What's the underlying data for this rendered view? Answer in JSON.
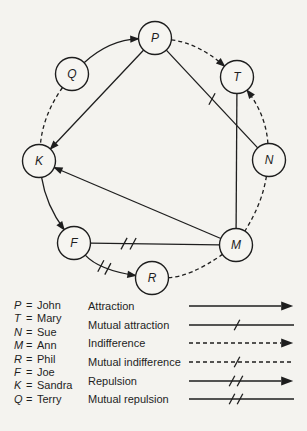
{
  "figure": {
    "background": "#f4f3ef",
    "ink": "#1e1e1e",
    "node_fill": "#f6f5f1"
  },
  "diagram": {
    "node_radius": 16.5,
    "nodes": [
      {
        "id": "P",
        "label": "P",
        "x": 155,
        "y": 38
      },
      {
        "id": "Q",
        "label": "Q",
        "x": 72,
        "y": 74
      },
      {
        "id": "T",
        "label": "T",
        "x": 237,
        "y": 77
      },
      {
        "id": "K",
        "label": "K",
        "x": 39,
        "y": 161
      },
      {
        "id": "N",
        "label": "N",
        "x": 269,
        "y": 160
      },
      {
        "id": "F",
        "label": "F",
        "x": 74,
        "y": 243
      },
      {
        "id": "M",
        "label": "M",
        "x": 236,
        "y": 245
      },
      {
        "id": "R",
        "label": "R",
        "x": 152,
        "y": 278
      }
    ],
    "edges": [
      {
        "from": "Q",
        "to": "P",
        "type": "attraction",
        "curve": [
          109,
          40
        ]
      },
      {
        "from": "P",
        "to": "T",
        "type": "indifference",
        "curve": [
          198,
          43
        ]
      },
      {
        "from": "P",
        "to": "K",
        "type": "attraction"
      },
      {
        "from": "P",
        "to": "N",
        "type": "mutual-attraction",
        "slashT": [
          0.5
        ]
      },
      {
        "from": "N",
        "to": "T",
        "type": "indifference",
        "curve": [
          266,
          115
        ]
      },
      {
        "from": "T",
        "to": "M",
        "type": "line-solid"
      },
      {
        "from": "N",
        "to": "M",
        "type": "line-dashed",
        "curve": [
          262,
          204
        ]
      },
      {
        "from": "M",
        "to": "K",
        "type": "attraction"
      },
      {
        "from": "Q",
        "to": "K",
        "type": "line-dashed",
        "curve": [
          43,
          115
        ]
      },
      {
        "from": "K",
        "to": "F",
        "type": "attraction",
        "curve": [
          46,
          205
        ]
      },
      {
        "from": "F",
        "to": "M",
        "type": "mutual-repulsion",
        "slashT": [
          0.26,
          0.33
        ]
      },
      {
        "from": "F",
        "to": "R",
        "type": "repulsion",
        "curve": [
          99,
          270
        ],
        "slashT": [
          0.42,
          0.56
        ]
      },
      {
        "from": "R",
        "to": "M",
        "type": "line-dashed",
        "curve": [
          190,
          277
        ]
      }
    ],
    "styles": {
      "attraction": {
        "dashed": false,
        "slashes": 0,
        "arrow": true
      },
      "mutual-attraction": {
        "dashed": false,
        "slashes": 1,
        "arrow": false
      },
      "indifference": {
        "dashed": true,
        "slashes": 0,
        "arrow": true
      },
      "mutual-indifference": {
        "dashed": true,
        "slashes": 1,
        "arrow": false
      },
      "repulsion": {
        "dashed": false,
        "slashes": 2,
        "arrow": true
      },
      "mutual-repulsion": {
        "dashed": false,
        "slashes": 2,
        "arrow": false
      },
      "line-solid": {
        "dashed": false,
        "slashes": 0,
        "arrow": false
      },
      "line-dashed": {
        "dashed": true,
        "slashes": 0,
        "arrow": false
      }
    }
  },
  "legend": {
    "people": [
      {
        "symbol": "P",
        "name": "John"
      },
      {
        "symbol": "T",
        "name": "Mary"
      },
      {
        "symbol": "N",
        "name": "Sue"
      },
      {
        "symbol": "M",
        "name": "Ann"
      },
      {
        "symbol": "R",
        "name": "Phil"
      },
      {
        "symbol": "F",
        "name": "Joe"
      },
      {
        "symbol": "K",
        "name": "Sandra"
      },
      {
        "symbol": "Q",
        "name": "Terry"
      }
    ],
    "relations": [
      {
        "label": "Attraction",
        "style": "attraction"
      },
      {
        "label": "Mutual attraction",
        "style": "mutual-attraction"
      },
      {
        "label": "Indifference",
        "style": "indifference"
      },
      {
        "label": "Mutual indifference",
        "style": "mutual-indifference"
      },
      {
        "label": "Repulsion",
        "style": "repulsion"
      },
      {
        "label": "Mutual repulsion",
        "style": "mutual-repulsion"
      }
    ]
  }
}
